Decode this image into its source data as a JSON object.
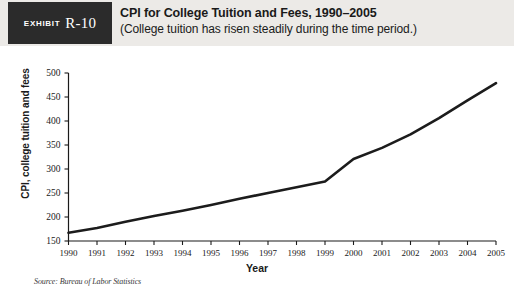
{
  "exhibit": {
    "kicker": "EXHIBIT",
    "number": "R-10"
  },
  "header": {
    "title": "CPI for College Tuition and Fees, 1990–2005",
    "subtitle": "(College tuition has risen steadily during the time period.)"
  },
  "source": {
    "text": "Source: Bureau of Labor Statistics"
  },
  "colors": {
    "tag_background": "#2b2b2b",
    "header_background": "#eceae7",
    "line": "#1c1c1c",
    "axis": "#1a1a1a",
    "plot_background": "#ffffff"
  },
  "chart_data": {
    "type": "line",
    "title": "CPI for College Tuition and Fees, 1990–2005",
    "subtitle": "(College tuition has risen steadily during the time period.)",
    "xlabel": "Year",
    "ylabel": "CPI, college tuition and fees",
    "x": [
      1990,
      1991,
      1992,
      1993,
      1994,
      1995,
      1996,
      1997,
      1998,
      1999,
      2000,
      2001,
      2002,
      2003,
      2004,
      2005
    ],
    "categories": [
      "1990",
      "1991",
      "1992",
      "1993",
      "1994",
      "1995",
      "1996",
      "1997",
      "1998",
      "1999",
      "2000",
      "2001",
      "2002",
      "2003",
      "2004",
      "2005"
    ],
    "values": [
      167,
      177,
      190,
      202,
      213,
      225,
      238,
      250,
      262,
      274,
      321,
      344,
      372,
      406,
      443,
      479
    ],
    "series": [
      {
        "name": "CPI, college tuition and fees",
        "values": [
          167,
          177,
          190,
          202,
          213,
          225,
          238,
          250,
          262,
          274,
          321,
          344,
          372,
          406,
          443,
          479
        ]
      }
    ],
    "ylim": [
      150,
      500
    ],
    "yticks": [
      150,
      200,
      250,
      300,
      350,
      400,
      450,
      500
    ],
    "ytick_labels": [
      "150",
      "200",
      "250",
      "300",
      "350",
      "400",
      "450",
      "500"
    ],
    "xlim": [
      1990,
      2005
    ],
    "grid": false,
    "legend": null,
    "legend_position": "none",
    "source": "Source: Bureau of Labor Statistics"
  }
}
